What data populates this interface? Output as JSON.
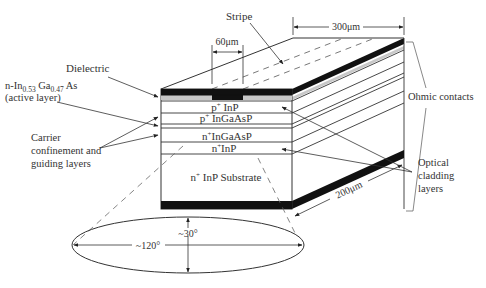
{
  "labels": {
    "stripe": "Stripe",
    "stripe_width": "60μm",
    "length": "300μm",
    "width": "200μm",
    "dielectric": "Dielectric",
    "active_line1_prefix": "n-In",
    "active_sub1": "0.53",
    "active_mid": " Ga",
    "active_sub2": "0.47",
    "active_suffix": " As",
    "active_line2": "(active layer)",
    "carrier_line1": "Carrier",
    "carrier_line2": "confinement and",
    "carrier_line3": "guiding layers",
    "ohmic": "Ohmic contacts",
    "optical_line1": "Optical",
    "optical_line2": "cladding",
    "optical_line3": "layers",
    "beam_horizontal": "~120°",
    "beam_vertical": "~30°"
  },
  "layers": [
    {
      "name": "p+ InP",
      "sup": "+",
      "base": "p",
      "rest": " InP"
    },
    {
      "name": "p+ InGaAsP",
      "sup": "+",
      "base": "p",
      "rest": " InGaAsP"
    },
    {
      "name": "n+ InGaAsP",
      "sup": "+",
      "base": "n",
      "rest": "InGaAsP"
    },
    {
      "name": "n+ InP",
      "sup": "+",
      "base": "n",
      "rest": "InP"
    },
    {
      "name": "n+ InP Substrate",
      "sup": "+",
      "base": "n",
      "rest": " InP Substrate"
    }
  ],
  "colors": {
    "contact": "#111111",
    "dielectric": "#c8c8c8",
    "line": "#333333"
  }
}
